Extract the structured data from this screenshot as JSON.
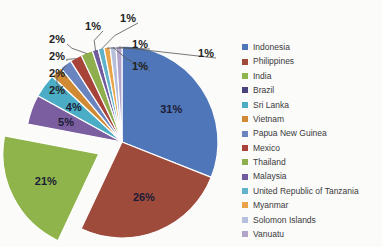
{
  "chart_data": {
    "type": "pie",
    "title": "",
    "legend_position": "right",
    "exploded_slice": "India",
    "start_angle_deg": 0,
    "categories": [
      "Indonesia",
      "Philippines",
      "India",
      "Brazil",
      "Sri Lanka",
      "Vietnam",
      "Papua New Guinea",
      "Mexico",
      "Thailand",
      "Malaysia",
      "United Republic of Tanzania",
      "Myanmar",
      "Solomon Islands",
      "Vanuatu"
    ],
    "values": [
      31,
      26,
      21,
      5,
      4,
      2,
      2,
      2,
      2,
      1,
      1,
      1,
      1,
      1
    ],
    "labels": [
      "31%",
      "26%",
      "21%",
      "5%",
      "4%",
      "2%",
      "2%",
      "2%",
      "2%",
      "1%",
      "1%",
      "1%",
      "1%",
      "1%"
    ],
    "colors": [
      "#4f76b8",
      "#9e4b3c",
      "#8eb44b",
      "#7b5ea0",
      "#4bacc6",
      "#d08a33",
      "#6a84c0",
      "#a8433a",
      "#8fae4e",
      "#6f5b9e",
      "#61b3cc",
      "#e9a44a",
      "#b6c0dd",
      "#b1a3c9"
    ]
  },
  "legend": {
    "items": [
      {
        "label": "Indonesia",
        "color": "#4f76b8"
      },
      {
        "label": "Philippines",
        "color": "#9e4b3c"
      },
      {
        "label": "India",
        "color": "#8eb44b"
      },
      {
        "label": "Brazil",
        "color": "#48427e"
      },
      {
        "label": "Sri Lanka",
        "color": "#4bacc6"
      },
      {
        "label": "Vietnam",
        "color": "#d08a33"
      },
      {
        "label": "Papua New Guinea",
        "color": "#6a84c0"
      },
      {
        "label": "Mexico",
        "color": "#a8433a"
      },
      {
        "label": "Thailand",
        "color": "#8fae4e"
      },
      {
        "label": "Malaysia",
        "color": "#6f5b9e"
      },
      {
        "label": "United Republic of Tanzania",
        "color": "#61b3cc"
      },
      {
        "label": "Myanmar",
        "color": "#e9a44a"
      },
      {
        "label": "Solomon Islands",
        "color": "#b6c0dd"
      },
      {
        "label": "Vanuatu",
        "color": "#b1a3c9"
      }
    ]
  }
}
